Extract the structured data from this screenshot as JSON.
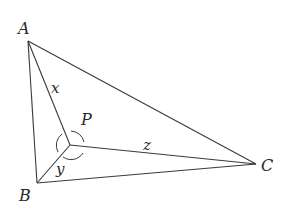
{
  "diagram": {
    "type": "triangle-with-interior-point",
    "points": {
      "A": {
        "label": "A",
        "x": 28,
        "y": 41
      },
      "B": {
        "label": "B",
        "x": 37,
        "y": 183
      },
      "C": {
        "label": "C",
        "x": 256,
        "y": 164
      },
      "P": {
        "label": "P",
        "x": 70,
        "y": 145
      }
    },
    "segments": [
      {
        "from": "A",
        "to": "B"
      },
      {
        "from": "B",
        "to": "C"
      },
      {
        "from": "A",
        "to": "C"
      },
      {
        "from": "P",
        "to": "A",
        "label": "x"
      },
      {
        "from": "P",
        "to": "B",
        "label": "y"
      },
      {
        "from": "P",
        "to": "C",
        "label": "z"
      }
    ],
    "labels": {
      "A": "A",
      "B": "B",
      "C": "C",
      "P": "P",
      "x": "x",
      "y": "y",
      "z": "z"
    },
    "angle_marks_at": "P",
    "colors": {
      "stroke": "#3a3a3a",
      "text": "#2a2a2a"
    }
  }
}
